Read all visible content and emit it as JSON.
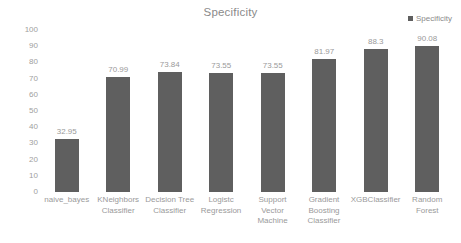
{
  "chart_data": {
    "type": "bar",
    "title": "Specificity",
    "xlabel": "",
    "ylabel": "",
    "ylim": [
      0,
      100
    ],
    "yticks": [
      100,
      90,
      80,
      70,
      60,
      50,
      40,
      30,
      20,
      10,
      0
    ],
    "grid": false,
    "legend": {
      "position": "top-right",
      "entries": [
        "Specificity"
      ]
    },
    "series_name": "Specificity",
    "bar_color": "#5f5f5f",
    "categories": [
      "naive_bayes",
      "KNeighbors Classifier",
      "Decision Tree Classifier",
      "Logistc Regression",
      "Support Vector Machine",
      "Gradient Boosting Classifier",
      "XGBClassifier",
      "Random Forest"
    ],
    "category_lines": [
      [
        "naive_bayes"
      ],
      [
        "KNeighbors",
        "Classifier"
      ],
      [
        "Decision Tree",
        "Classifier"
      ],
      [
        "Logistc",
        "Regression"
      ],
      [
        "Support",
        "Vector",
        "Machine"
      ],
      [
        "Gradient",
        "Boosting",
        "Classifier"
      ],
      [
        "XGBClassifier"
      ],
      [
        "Random",
        "Forest"
      ]
    ],
    "values": [
      32.95,
      70.99,
      73.84,
      73.55,
      73.55,
      81.97,
      88.3,
      90.08
    ],
    "value_labels": [
      "32.95",
      "70.99",
      "73.84",
      "73.55",
      "73.55",
      "81.97",
      "88.3",
      "90.08"
    ]
  }
}
